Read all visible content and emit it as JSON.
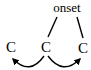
{
  "diagram": {
    "node_label": "onset",
    "segments": [
      {
        "label": "C",
        "x": 11,
        "y": 52
      },
      {
        "label": "C",
        "x": 46,
        "y": 52
      },
      {
        "label": "C",
        "x": 83,
        "y": 53
      }
    ],
    "association_lines": [
      {
        "from": "onset",
        "to": 1
      },
      {
        "from": "onset",
        "to": 2
      }
    ],
    "arrows": [
      {
        "from": 1,
        "to": 0,
        "description": "curved arrow from middle C to left C"
      },
      {
        "from": 1,
        "to": 2,
        "description": "curved arrow from middle C to right C"
      }
    ],
    "colors": {
      "ink": "#000000",
      "background": "#ffffff"
    }
  }
}
